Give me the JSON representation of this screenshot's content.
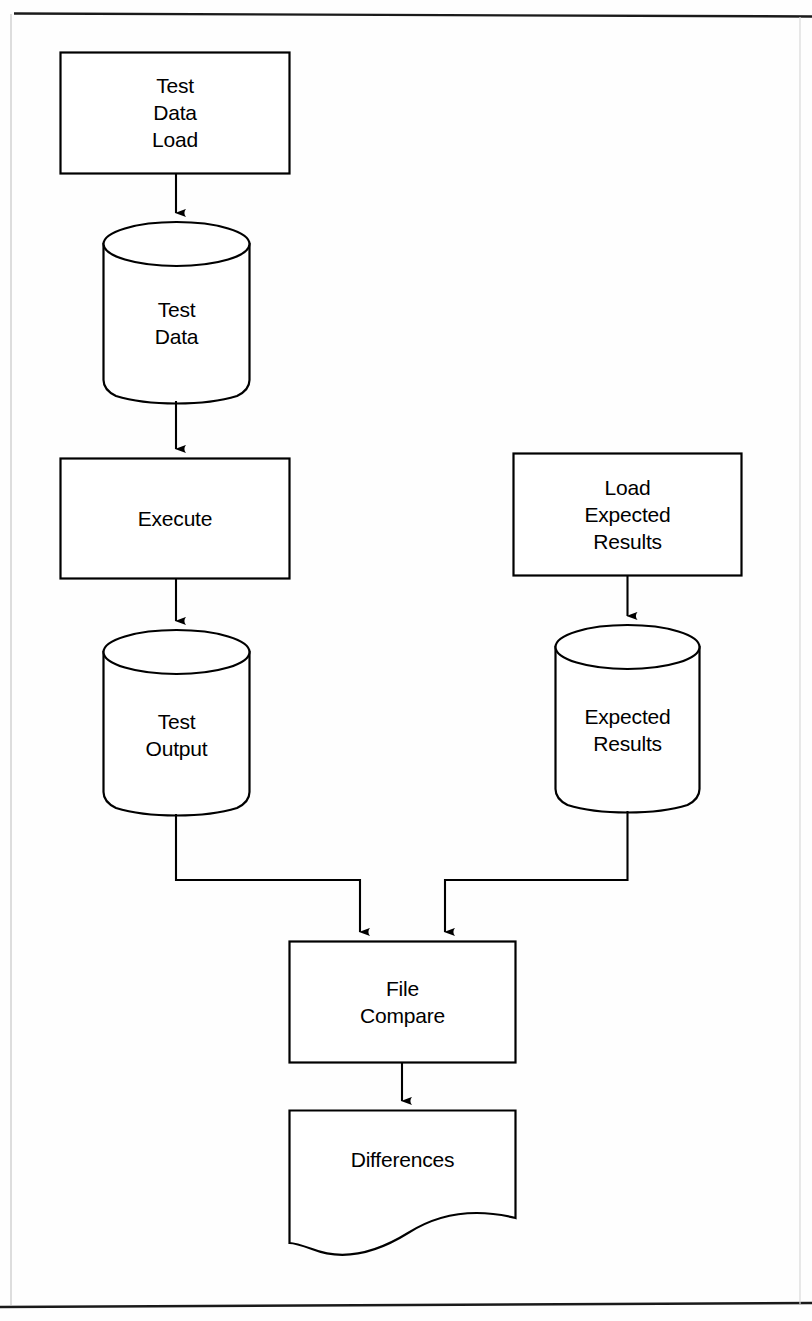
{
  "page": {
    "width": 812,
    "height": 1321,
    "background_color": "#fefefe",
    "line_color": "#000000",
    "text_color": "#000000",
    "border_top_y": 13,
    "border_bottom_y": 1306
  },
  "diagram": {
    "type": "flowchart",
    "orientation": "top-to-bottom",
    "nodes": [
      {
        "id": "test-data-load",
        "label": "Test\nData\nLoad",
        "shape": "process-rectangle",
        "x": 60,
        "y": 52,
        "width": 230,
        "height": 122
      },
      {
        "id": "test-data",
        "label": "Test\nData",
        "shape": "database-cylinder",
        "x": 103,
        "y": 222,
        "width": 147,
        "height": 180
      },
      {
        "id": "execute",
        "label": "Execute",
        "shape": "process-rectangle",
        "x": 60,
        "y": 458,
        "width": 230,
        "height": 121
      },
      {
        "id": "load-expected-results",
        "label": "Load\nExpected\nResults",
        "shape": "process-rectangle",
        "x": 513,
        "y": 453,
        "width": 229,
        "height": 123
      },
      {
        "id": "test-output",
        "label": "Test\nOutput",
        "shape": "database-cylinder",
        "x": 103,
        "y": 630,
        "width": 147,
        "height": 185
      },
      {
        "id": "expected-results",
        "label": "Expected\nResults",
        "shape": "database-cylinder",
        "x": 555,
        "y": 625,
        "width": 145,
        "height": 187
      },
      {
        "id": "file-compare",
        "label": "File\nCompare",
        "shape": "process-rectangle",
        "x": 289,
        "y": 941,
        "width": 227,
        "height": 122
      },
      {
        "id": "differences",
        "label": "Differences",
        "shape": "document",
        "x": 289,
        "y": 1110,
        "width": 227,
        "height": 140
      }
    ],
    "edges": [
      {
        "id": "e1",
        "from": "test-data-load",
        "to": "test-data",
        "style": "straight-vertical",
        "arrow": true
      },
      {
        "id": "e2",
        "from": "test-data",
        "to": "execute",
        "style": "straight-vertical",
        "arrow": true
      },
      {
        "id": "e3",
        "from": "execute",
        "to": "test-output",
        "style": "straight-vertical",
        "arrow": true
      },
      {
        "id": "e4",
        "from": "load-expected-results",
        "to": "expected-results",
        "style": "straight-vertical",
        "arrow": true
      },
      {
        "id": "e5",
        "from": "test-output",
        "to": "file-compare",
        "style": "orthogonal-elbow",
        "arrow": true
      },
      {
        "id": "e6",
        "from": "expected-results",
        "to": "file-compare",
        "style": "orthogonal-elbow",
        "arrow": true
      },
      {
        "id": "e7",
        "from": "file-compare",
        "to": "differences",
        "style": "straight-vertical",
        "arrow": true
      }
    ]
  }
}
